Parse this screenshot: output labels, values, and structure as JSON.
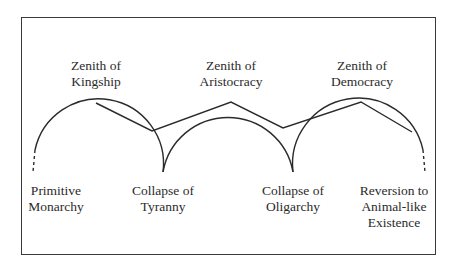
{
  "diagram": {
    "type": "cycle-of-constitutions",
    "top_labels": [
      {
        "line1": "Zenith of",
        "line2": "Kingship"
      },
      {
        "line1": "Zenith of",
        "line2": "Aristocracy"
      },
      {
        "line1": "Zenith of",
        "line2": "Democracy"
      }
    ],
    "bottom_labels": [
      {
        "line1": "Primitive",
        "line2": "Monarchy",
        "line3": ""
      },
      {
        "line1": "Collapse of",
        "line2": "Tyranny",
        "line3": ""
      },
      {
        "line1": "Collapse of",
        "line2": "Oligarchy",
        "line3": ""
      },
      {
        "line1": "Reversion to",
        "line2": "Animal-like",
        "line3": "Existence"
      }
    ],
    "colors": {
      "line": "#2a2a2a",
      "frame": "#3a3a3a",
      "background": "#ffffff"
    }
  }
}
